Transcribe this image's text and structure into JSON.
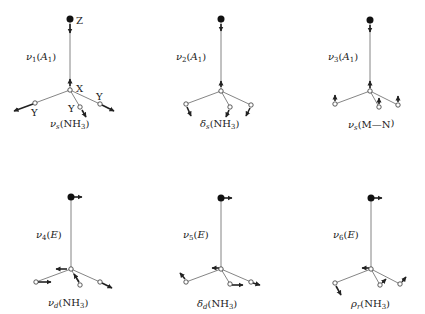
{
  "header": {
    "text": ""
  },
  "axis_labels": {
    "z": "Z",
    "x": "X",
    "y": "Y"
  },
  "modes": [
    {
      "id": "nu1",
      "symbol": "ν",
      "index": "1",
      "symmetry": "A",
      "sym_sub": "1",
      "description": "ν",
      "desc_sub": "s",
      "desc_group": "(NH",
      "desc_group_sub": "3",
      "desc_end": ")",
      "label": "ν1(A1)",
      "caption": "νs(NH3)"
    },
    {
      "id": "nu2",
      "symbol": "ν",
      "index": "2",
      "symmetry": "A",
      "sym_sub": "1",
      "description": "δ",
      "desc_sub": "s",
      "desc_group": "(NH",
      "desc_group_sub": "3",
      "desc_end": ")",
      "label": "ν2(A1)",
      "caption": "δs(NH3)"
    },
    {
      "id": "nu3",
      "symbol": "ν",
      "index": "3",
      "symmetry": "A",
      "sym_sub": "1",
      "description": "ν",
      "desc_sub": "s",
      "desc_group": "(M—N",
      "desc_group_sub": "",
      "desc_end": ")",
      "label": "ν3(A1)",
      "caption": "νs(M—N)"
    },
    {
      "id": "nu4",
      "symbol": "ν",
      "index": "4",
      "symmetry": "E",
      "sym_sub": "",
      "description": "ν",
      "desc_sub": "d",
      "desc_group": "(NH",
      "desc_group_sub": "3",
      "desc_end": ")",
      "label": "ν4(E)",
      "caption": "νd(NH3)"
    },
    {
      "id": "nu5",
      "symbol": "ν",
      "index": "5",
      "symmetry": "E",
      "sym_sub": "",
      "description": "δ",
      "desc_sub": "d",
      "desc_group": "(NH",
      "desc_group_sub": "3",
      "desc_end": ")",
      "label": "ν5(E)",
      "caption": "δd(NH3)"
    },
    {
      "id": "nu6",
      "symbol": "ν",
      "index": "6",
      "symmetry": "E",
      "sym_sub": "",
      "description": "ρ",
      "desc_sub": "r",
      "desc_group": "(NH",
      "desc_group_sub": "3",
      "desc_end": ")",
      "label": "ν6(E)",
      "caption": "ρr(NH3)"
    }
  ],
  "colors": {
    "ink": "#222222",
    "bond": "#666666",
    "background": "#ffffff"
  }
}
